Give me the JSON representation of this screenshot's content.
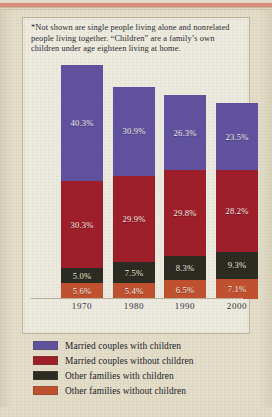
{
  "footnote": "*Not shown are single people living alone and nonrelated people living together. “Children” are a family’s own children under age eighteen living at home.",
  "colors": {
    "married_with_children": "#5f51a0",
    "married_without_children": "#9e1d2a",
    "other_with_children": "#2b2a22",
    "other_without_children": "#c0502f",
    "panel_background": "#edeae0",
    "page_background": "#e3ddc9",
    "top_rule": "#d98f7c"
  },
  "legend": [
    {
      "label": "Married couples with children",
      "color": "#5f51a0"
    },
    {
      "label": "Married couples without children",
      "color": "#9e1d2a"
    },
    {
      "label": "Other families with children",
      "color": "#2b2a22"
    },
    {
      "label": "Other families without children",
      "color": "#c0502f"
    }
  ],
  "chart_data": {
    "type": "bar",
    "title": "",
    "subtitle": "",
    "xlabel": "",
    "ylabel": "",
    "stacked": true,
    "grid": false,
    "legend_position": "bottom",
    "categories": [
      "1970",
      "1980",
      "1990",
      "2000"
    ],
    "ylim": [
      0,
      85
    ],
    "series": [
      {
        "name": "Married couples with children",
        "color": "#5f51a0",
        "values": [
          40.3,
          30.9,
          26.3,
          23.5
        ]
      },
      {
        "name": "Married couples without children",
        "color": "#9e1d2a",
        "values": [
          30.3,
          29.9,
          29.8,
          28.2
        ]
      },
      {
        "name": "Other families with children",
        "color": "#2b2a22",
        "values": [
          5.0,
          7.5,
          8.3,
          9.3
        ]
      },
      {
        "name": "Other families without children",
        "color": "#c0502f",
        "values": [
          5.6,
          5.4,
          6.5,
          7.1
        ]
      }
    ],
    "value_labels": [
      [
        "40.3%",
        "30.9%",
        "26.3%",
        "23.5%"
      ],
      [
        "30.3%",
        "29.9%",
        "29.8%",
        "28.2%"
      ],
      [
        "5.0%",
        "7.5%",
        "8.3%",
        "9.3%"
      ],
      [
        "5.6%",
        "5.4%",
        "6.5%",
        "7.1%"
      ]
    ],
    "totals": [
      81.2,
      73.7,
      70.9,
      68.1
    ]
  }
}
